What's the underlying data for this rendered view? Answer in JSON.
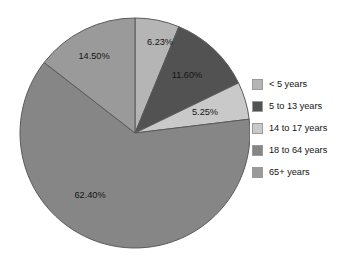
{
  "chart_data": {
    "type": "pie",
    "title": "",
    "categories": [
      "< 5 years",
      "5 to 13 years",
      "14 to 17 years",
      "18 to 64 years",
      "65+ years"
    ],
    "values": [
      6.23,
      11.6,
      5.25,
      62.4,
      14.5
    ],
    "value_labels": [
      "6.23%",
      "11.60%",
      "5.25%",
      "62.40%",
      "14.50%"
    ],
    "colors": [
      "#b5b5b5",
      "#525252",
      "#c9c9c9",
      "#868686",
      "#9a9a9a"
    ],
    "legend_position": "right",
    "legend_entries": [
      {
        "label": "< 5 years",
        "color": "#b5b5b5",
        "value": 6.23,
        "value_label": "6.23%"
      },
      {
        "label": "5 to 13 years",
        "color": "#525252",
        "value": 11.6,
        "value_label": "11.60%"
      },
      {
        "label": "14 to 17 years",
        "color": "#c9c9c9",
        "value": 5.25,
        "value_label": "5.25%"
      },
      {
        "label": "18 to 64 years",
        "color": "#868686",
        "value": 62.4,
        "value_label": "62.40%"
      },
      {
        "label": "65+ years",
        "color": "#9a9a9a",
        "value": 14.5,
        "value_label": "14.50%"
      }
    ],
    "start_angle_deg": 0,
    "direction": "clockwise",
    "grid": false,
    "xlabel": "",
    "ylabel": ""
  },
  "slice_label_positions": [
    {
      "x": 160,
      "y": 43
    },
    {
      "x": 187,
      "y": 76
    },
    {
      "x": 205,
      "y": 113
    },
    {
      "x": 90,
      "y": 196
    },
    {
      "x": 94,
      "y": 57
    }
  ],
  "pie": {
    "center_x": 135,
    "center_y": 133,
    "radius": 115,
    "stroke": "#5a5a5a"
  }
}
